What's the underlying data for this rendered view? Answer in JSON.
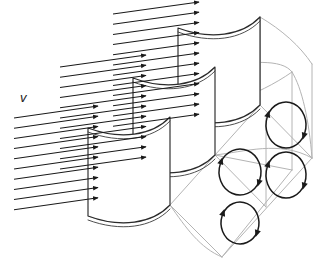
{
  "figure": {
    "domain": "diagram",
    "width": 327,
    "height": 278,
    "background_color": "#ffffff"
  },
  "labels": {
    "velocity": "v"
  },
  "colors": {
    "ink": "#1a1a1a",
    "vane_outline": "#2b2b2b",
    "duct_structure": "#b4b4b4",
    "duct_structure_dark": "#7a7a7a",
    "background": "#ffffff"
  },
  "legend": {
    "velocity_symbol": "v",
    "velocity_meaning": "inlet velocity profile",
    "vortex_meaning": "secondary-flow vortex pairs"
  },
  "chart_data": {
    "type": "diagram",
    "elements": {
      "turning_vanes": 3,
      "vane_names": [
        "front-vane",
        "middle-vane",
        "rear-vane"
      ],
      "velocity_arrow_groups": 3,
      "velocity_arrows_per_group": [
        10,
        11,
        12
      ],
      "velocity_arrows_total": 33,
      "vortices": 4,
      "vortex_names": [
        "vortex-upper-right",
        "vortex-middle-right",
        "vortex-middle-left",
        "vortex-lower-left"
      ],
      "vortex_rotation": [
        "clockwise",
        "clockwise",
        "clockwise",
        "clockwise"
      ]
    },
    "annotations": [
      {
        "text": "v",
        "x": 25,
        "y": 98,
        "meaning": "inlet velocity"
      }
    ]
  },
  "geometry": {
    "duct_outline": {
      "description": "Isometric curved rectangular duct outline drawn in light gray",
      "stroke": "#b4b4b4"
    },
    "vanes": [
      {
        "name": "front-vane",
        "face_path": "M 88,128 L 88,216 C 120,228 152,224 170,205 L 170,117 C 152,136 120,140 88,128 Z",
        "top_curve": "M 88,128 C 120,140 152,136 170,117",
        "bottom_curve": "M 88,216 C 120,228 152,224 170,205"
      },
      {
        "name": "middle-vane",
        "face_path": "M 133,78 L 133,166 C 165,178 197,174 215,155 L 215,67 C 197,86 165,90 133,78 Z",
        "top_curve": "M 133,78 C 165,90 197,86 215,67",
        "bottom_curve": "M 133,166 C 165,178 197,174 215,155"
      },
      {
        "name": "rear-vane",
        "face_path": "M 178,28 L 178,116 C 210,128 242,124 260,105 L 260,17 C 242,36 210,40 178,28 Z",
        "top_curve": "M 178,28 C 210,40 242,36 260,17",
        "bottom_curve": "M 178,116 C 210,128 242,124 260,105"
      }
    ],
    "velocity_arrow_groups": [
      {
        "name": "lower-group",
        "count": 10,
        "x_start": 14,
        "x_end": 56,
        "y_top": 118,
        "y_step": 10.2,
        "dx": 42,
        "dy": -12
      },
      {
        "name": "middle-group",
        "count": 11,
        "x_start": 60,
        "x_end": 103,
        "y_top": 67,
        "y_step": 10.2,
        "dx": 43,
        "dy": -12
      },
      {
        "name": "upper-group",
        "count": 12,
        "x_start": 113,
        "x_end": 156,
        "y_top": 14,
        "y_step": 10.2,
        "dx": 43,
        "dy": -12
      }
    ],
    "vortices": [
      {
        "name": "vortex-upper-right",
        "cx": 286,
        "cy": 125,
        "rx": 20,
        "ry": 23
      },
      {
        "name": "vortex-middle-right",
        "cx": 286,
        "cy": 175,
        "rx": 20,
        "ry": 23
      },
      {
        "name": "vortex-middle-left",
        "cx": 240,
        "cy": 172,
        "rx": 21,
        "ry": 23
      },
      {
        "name": "vortex-lower-left",
        "cx": 240,
        "cy": 223,
        "rx": 19,
        "ry": 21
      }
    ]
  }
}
